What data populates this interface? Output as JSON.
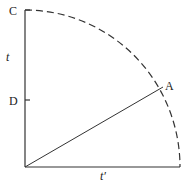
{
  "diagram": {
    "labels": {
      "C": "C",
      "D": "D",
      "A": "A",
      "vertical_axis": "t",
      "horizontal_axis": "t′"
    },
    "colors": {
      "stroke": "#333333",
      "text": "#222222"
    },
    "elements": {
      "arc": "dashed quarter circle from C to end of horizontal axis",
      "radius_line": "solid line from origin to A"
    }
  }
}
